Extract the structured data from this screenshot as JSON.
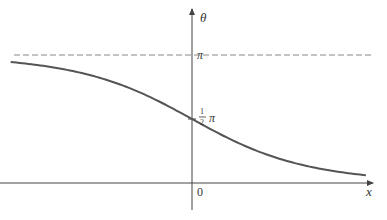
{
  "chart_data": {
    "type": "line",
    "title": "",
    "xlabel": "x",
    "ylabel": "θ",
    "origin_label": "0",
    "series": [
      {
        "name": "θ(x) = π − 2·arctan(eˣ)",
        "x": [
          -2.45,
          -2.0,
          -1.5,
          -1.0,
          -0.5,
          0.0,
          0.5,
          1.0,
          1.5,
          2.0,
          2.35
        ],
        "y_over_pi": [
          0.944,
          0.916,
          0.851,
          0.76,
          0.628,
          0.5,
          0.372,
          0.24,
          0.149,
          0.084,
          0.061
        ]
      }
    ],
    "reference_lines": [
      {
        "name": "asymptote",
        "y_over_pi": 1,
        "style": "dashed",
        "label": "π"
      }
    ],
    "annotations": [
      {
        "text_num": "1",
        "text_den": "2",
        "text_suffix": "π",
        "at": "y-intercept",
        "y_over_pi": 0.5
      }
    ],
    "ylim_over_pi": [
      0,
      1.05
    ],
    "grid": false,
    "legend": "none",
    "colors": {
      "curve": "#555555",
      "axis": "#444444",
      "dashed": "#888888"
    }
  },
  "labels": {
    "theta": "θ",
    "pi": "π",
    "half_num": "1",
    "half_den": "2",
    "half_pi": "π",
    "zero": "0",
    "x": "x"
  }
}
